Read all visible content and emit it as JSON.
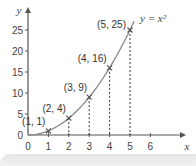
{
  "chart_data": {
    "type": "line",
    "title": "",
    "xlabel": "x",
    "ylabel": "y",
    "curve_label": "y = x²",
    "xlim": [
      0,
      6.5
    ],
    "ylim": [
      0,
      27
    ],
    "x_ticks": [
      "0",
      "1",
      "2",
      "3",
      "4",
      "5",
      "6"
    ],
    "y_ticks": [
      "0",
      "5",
      "10",
      "15",
      "20",
      "25"
    ],
    "series": [
      {
        "name": "y = x^2",
        "x": [
          0,
          1,
          2,
          3,
          4,
          5
        ],
        "values": [
          0,
          1,
          4,
          9,
          16,
          25
        ]
      }
    ],
    "points": [
      {
        "label": "(1, 1)",
        "x": 1,
        "y": 1
      },
      {
        "label": "(2, 4)",
        "x": 2,
        "y": 4
      },
      {
        "label": "(3, 9)",
        "x": 3,
        "y": 9
      },
      {
        "label": "(4, 16)",
        "x": 4,
        "y": 16
      },
      {
        "label": "(5, 25)",
        "x": 5,
        "y": 25
      }
    ],
    "grid": false,
    "dashed_drop_lines": true
  },
  "colors": {
    "curve": "#888888",
    "axis": "#555555",
    "marker": "#555555"
  }
}
